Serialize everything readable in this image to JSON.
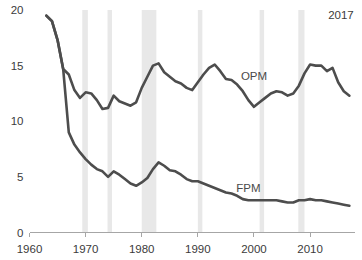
{
  "chart_data": {
    "type": "line",
    "title": "",
    "subtitle": "",
    "xlabel": "",
    "ylabel": "",
    "xlim": [
      1960,
      2018
    ],
    "ylim": [
      0,
      20
    ],
    "grid": false,
    "legend_position": "inline-annotation",
    "x_ticks": [
      "1960",
      "1970",
      "1980",
      "1990",
      "2000",
      "2010"
    ],
    "x_tick_values": [
      1960,
      1970,
      1980,
      1990,
      2000,
      2010
    ],
    "y_ticks": [
      "0",
      "5",
      "10",
      "15",
      "20"
    ],
    "y_tick_values": [
      0,
      5,
      10,
      15,
      20
    ],
    "annotations": [
      {
        "text": "2017",
        "x": 2015.5,
        "y": 19.2,
        "name": "end-year-note"
      }
    ],
    "shaded_regions": [
      {
        "name": "recession-1969-1970",
        "x0": 1969.4,
        "x1": 1970.4
      },
      {
        "name": "recession-1973-1975",
        "x0": 1973.9,
        "x1": 1974.7
      },
      {
        "name": "recession-1980-1982",
        "x0": 1980.0,
        "x1": 1982.6
      },
      {
        "name": "recession-1990-1991",
        "x0": 1990.0,
        "x1": 1990.8
      },
      {
        "name": "recession-2001",
        "x0": 2001.0,
        "x1": 2001.8
      },
      {
        "name": "recession-2007-2009",
        "x0": 2007.9,
        "x1": 2009.0
      }
    ],
    "x": [
      1963,
      1964,
      1965,
      1966,
      1967,
      1968,
      1969,
      1970,
      1971,
      1972,
      1973,
      1974,
      1975,
      1976,
      1977,
      1978,
      1979,
      1980,
      1981,
      1982,
      1983,
      1984,
      1985,
      1986,
      1987,
      1988,
      1989,
      1990,
      1991,
      1992,
      1993,
      1994,
      1995,
      1996,
      1997,
      1998,
      1999,
      2000,
      2001,
      2002,
      2003,
      2004,
      2005,
      2006,
      2007,
      2008,
      2009,
      2010,
      2011,
      2012,
      2013,
      2014,
      2015,
      2016,
      2017
    ],
    "series": [
      {
        "name": "OPM",
        "label": "OPM",
        "color": "#4d4d4d",
        "label_x": 2000.0,
        "label_y": 13.7,
        "values": [
          19.5,
          19.0,
          17.3,
          14.7,
          14.2,
          12.8,
          12.1,
          12.6,
          12.5,
          11.9,
          11.1,
          11.2,
          12.3,
          11.8,
          11.6,
          11.4,
          11.7,
          13.0,
          14.0,
          15.0,
          15.2,
          14.4,
          14.0,
          13.6,
          13.4,
          13.0,
          12.8,
          13.5,
          14.2,
          14.8,
          15.1,
          14.5,
          13.8,
          13.7,
          13.3,
          12.7,
          11.9,
          11.3,
          11.7,
          12.1,
          12.5,
          12.7,
          12.6,
          12.3,
          12.5,
          13.2,
          14.3,
          15.1,
          15.0,
          15.0,
          14.5,
          14.8,
          13.5,
          12.7,
          12.3
        ]
      },
      {
        "name": "FPM",
        "label": "FPM",
        "color": "#4d4d4d",
        "label_x": 1999.0,
        "label_y": 3.6,
        "values": [
          19.5,
          19.0,
          17.3,
          14.7,
          9.0,
          7.9,
          7.2,
          6.6,
          6.1,
          5.7,
          5.5,
          5.0,
          5.5,
          5.2,
          4.8,
          4.4,
          4.2,
          4.5,
          4.9,
          5.7,
          6.3,
          6.0,
          5.6,
          5.5,
          5.2,
          4.8,
          4.6,
          4.6,
          4.4,
          4.2,
          4.0,
          3.8,
          3.6,
          3.5,
          3.3,
          3.0,
          2.9,
          2.9,
          2.9,
          2.9,
          2.9,
          2.9,
          2.8,
          2.7,
          2.7,
          2.9,
          2.9,
          3.0,
          2.9,
          2.9,
          2.8,
          2.7,
          2.6,
          2.5,
          2.4
        ]
      }
    ]
  }
}
